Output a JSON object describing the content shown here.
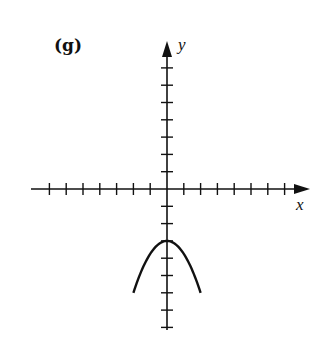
{
  "chart_data": {
    "type": "line",
    "title": "(g)",
    "xlabel": "x",
    "ylabel": "y",
    "xlim": [
      -8,
      8
    ],
    "ylim": [
      -8,
      8
    ],
    "x_ticks": [
      -7,
      -6,
      -5,
      -4,
      -3,
      -2,
      -1,
      1,
      2,
      3,
      4,
      5,
      6,
      7
    ],
    "y_ticks": [
      -8,
      -7,
      -6,
      -5,
      -4,
      -3,
      -2,
      -1,
      1,
      2,
      3,
      4,
      5,
      6,
      7
    ],
    "tick_labels_shown": false,
    "grid": false,
    "series": [
      {
        "name": "parabola",
        "equation": "y = -3 - 0.75x^2",
        "x": [
          -2,
          -1.5,
          -1,
          -0.5,
          0,
          0.5,
          1,
          1.5,
          2
        ],
        "y": [
          -6,
          -4.69,
          -3.75,
          -3.19,
          -3,
          -3.19,
          -3.75,
          -4.69,
          -6
        ]
      }
    ],
    "vertex": [
      0,
      -3
    ],
    "line_color": "#111111"
  },
  "figure": {
    "panel_label": "(g)",
    "x_axis_label": "x",
    "y_axis_label": "y"
  }
}
